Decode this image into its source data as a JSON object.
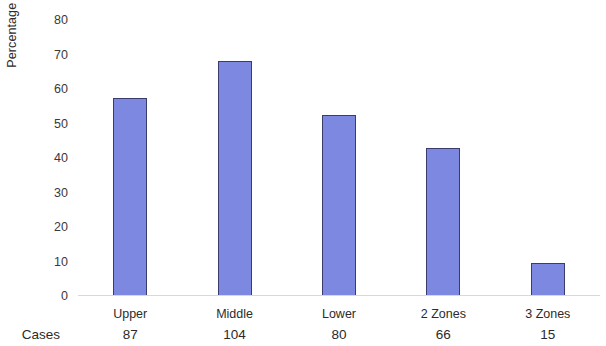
{
  "chart_data": {
    "type": "bar",
    "title": "",
    "subtitle": "",
    "xlabel": "",
    "ylabel": "Percentage Of Cases",
    "categories": [
      "Upper",
      "Middle",
      "Lower",
      "2 Zones",
      "3 Zones"
    ],
    "values": [
      57.5,
      68.0,
      52.5,
      43.0,
      9.5
    ],
    "ylim": [
      0,
      80
    ],
    "yticks": [
      80,
      70,
      60,
      50,
      40,
      30,
      20,
      10,
      0
    ],
    "ytick_labels": [
      "80",
      "70",
      "60",
      "50",
      "40",
      "30",
      "20",
      "10",
      "0"
    ],
    "grid": false,
    "legend": null,
    "series": [
      {
        "name": "Percentage Of Cases",
        "values": [
          57.5,
          68.0,
          52.5,
          43.0,
          9.5
        ]
      }
    ],
    "annotations": {
      "row_label": "Cases",
      "row_values": [
        "87",
        "104",
        "80",
        "66",
        "15"
      ]
    },
    "colors": {
      "bar_fill": "#7d88e0",
      "bar_border": "#3b3b6d",
      "text": "#2b2b2b",
      "axis_line": "#d8d8d8",
      "background": "#ffffff"
    }
  },
  "axis": {
    "y_title": "Percentage Of Cases"
  },
  "table": {
    "cases_label": "Cases"
  }
}
